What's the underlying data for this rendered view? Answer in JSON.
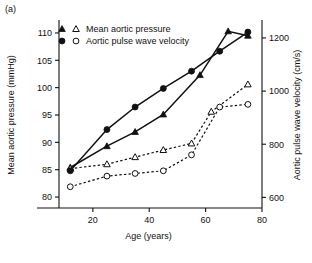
{
  "panel": {
    "label": "(a)"
  },
  "legend": {
    "entries": [
      {
        "label": "Mean aortic pressure",
        "symbols": [
          "filled-triangle",
          "open-triangle"
        ]
      },
      {
        "label": "Aortic pulse wave velocity",
        "symbols": [
          "filled-circle",
          "open-circle"
        ]
      }
    ]
  },
  "chart_data": {
    "type": "line",
    "title": "",
    "xlabel": "Age (years)",
    "ylabel": "Mean aortic pressure (mmHg)",
    "y2label": "Aortic pulse wave velocity (cm/s)",
    "xlim": [
      8,
      80
    ],
    "xticks": [
      20,
      40,
      60,
      80
    ],
    "ylim": [
      78,
      112
    ],
    "yticks": [
      80,
      85,
      90,
      95,
      100,
      105,
      110
    ],
    "y2lim": [
      560,
      1260
    ],
    "y2ticks": [
      600,
      800,
      1000,
      1200
    ],
    "grid": false,
    "legend_position": "top-left-inside",
    "series": [
      {
        "name": "Mean aortic pressure (filled triangle)",
        "marker": "filled-triangle",
        "line": "solid",
        "axis": "left",
        "x": [
          12,
          25,
          35,
          45,
          58,
          68,
          75
        ],
        "values": [
          85.4,
          89.3,
          91.9,
          95.1,
          102.3,
          110.3,
          109.5
        ]
      },
      {
        "name": "Mean aortic pressure (open triangle)",
        "marker": "open-triangle",
        "line": "dashed",
        "axis": "left",
        "x": [
          12,
          25,
          35,
          45,
          55,
          62,
          75
        ],
        "values": [
          85.2,
          86.0,
          87.3,
          88.6,
          89.8,
          95.6,
          100.6
        ]
      },
      {
        "name": "Aortic pulse wave velocity (filled circle)",
        "marker": "filled-circle",
        "line": "solid",
        "axis": "right",
        "x": [
          12,
          25,
          35,
          45,
          55,
          65,
          75
        ],
        "values": [
          700,
          855,
          940,
          1010,
          1075,
          1150,
          1222
        ]
      },
      {
        "name": "Aortic pulse wave velocity (open circle)",
        "marker": "open-circle",
        "line": "dashed",
        "axis": "right",
        "x": [
          12,
          25,
          35,
          45,
          55,
          65,
          75
        ],
        "values": [
          640,
          680,
          690,
          700,
          760,
          940,
          950
        ]
      }
    ]
  }
}
